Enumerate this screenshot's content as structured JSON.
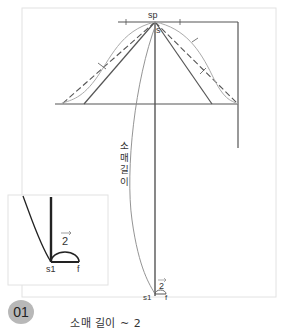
{
  "diagram": {
    "labels": {
      "sp": "sp",
      "s": "s",
      "sleeve_length": "소매길이",
      "s1_main": "s1",
      "f_main": "f",
      "half_main": "2",
      "s1_inset": "s1",
      "f_inset": "f",
      "half_inset": "2"
    },
    "colors": {
      "line": "#555555",
      "guide": "#aaaaaa",
      "frame": "#e2e2e2",
      "inset_line": "#222222",
      "badge": "#b8b8b8"
    }
  },
  "step": {
    "number": "01"
  },
  "caption": {
    "text": "소매 길이          ~  2"
  }
}
